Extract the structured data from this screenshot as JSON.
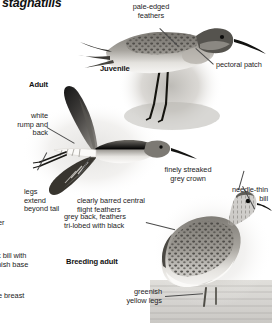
{
  "plate": {
    "title": "stagnatilis",
    "species_labels": [
      {
        "id": "juvenile",
        "text": "Juvenile"
      },
      {
        "id": "adult",
        "text": "Adult"
      },
      {
        "id": "breeding-adult",
        "text": "Breeding adult"
      }
    ],
    "annotations": [
      {
        "id": "pale-edged-feathers",
        "text": "pale-edged\nfeathers"
      },
      {
        "id": "pectoral-patch",
        "text": "pectoral patch"
      },
      {
        "id": "white-rump-and-back",
        "text": "white\nrump and\nback"
      },
      {
        "id": "legs-extend-beyond-tail",
        "text": "legs\nextend\nbeyond tail"
      },
      {
        "id": "clearly-barred-central-flight-feathers",
        "text": "clearly barred central\nflight feathers"
      },
      {
        "id": "finely-streaked-grey-crown",
        "text": "finely streaked\ngrey crown"
      },
      {
        "id": "needle-thin-bill",
        "text": "needle-thin\nbill"
      },
      {
        "id": "grey-back-feathers-tri-lobed",
        "text": "grey back, feathers\ntri-lobed with black"
      },
      {
        "id": "greenish-yellow-legs",
        "text": "greenish\nyellow legs"
      }
    ],
    "clipped_annotations": [
      {
        "id": "clipped-er",
        "text": "er"
      },
      {
        "id": "clipped-dark-bill",
        "text": "k bill with\nnish base"
      },
      {
        "id": "clipped-breast",
        "text": "e breast"
      }
    ],
    "colors": {
      "background": "#ffffff",
      "text": "#1d1d1d",
      "leader_line": "#4b4b4b",
      "plumage_dark": "#2c2c2c",
      "plumage_mid": "#8d8a85",
      "plumage_light": "#dedbd6",
      "water": "#cfcdc9"
    }
  }
}
